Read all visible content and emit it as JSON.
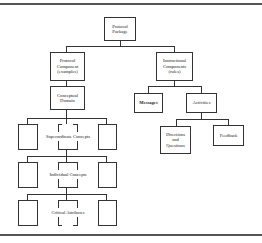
{
  "diagram": {
    "type": "hierarchy",
    "root": {
      "label": "Protocol Package",
      "children": [
        {
          "label": "Protocol Component (examples)",
          "children": [
            {
              "label": "Conceptual Domain",
              "children": [
                {
                  "level_label": "Superordinate Concepts",
                  "placeholders": 3
                },
                {
                  "level_label": "Individual Concepts",
                  "placeholders": 3
                },
                {
                  "level_label": "Critical Attributes",
                  "placeholders": 3
                }
              ]
            }
          ]
        },
        {
          "label": "Instructional Components (rules)",
          "children": [
            {
              "label": "Messages"
            },
            {
              "label": "Activities",
              "children": [
                {
                  "label": "Directions and Questions"
                },
                {
                  "label": "Feedback"
                }
              ]
            }
          ]
        }
      ]
    }
  },
  "nodes": {
    "protocol_package": [
      "Protocol",
      "Package"
    ],
    "protocol_component": [
      "Protocol",
      "Component",
      "(examples)"
    ],
    "instructional_components": [
      "Instructional",
      "Components",
      "(rules)"
    ],
    "conceptual_domain": [
      "Conceptual",
      "Domain"
    ],
    "messages": "Messages",
    "activities": "Activities",
    "directions_questions": [
      "Directions",
      "and",
      "Questions"
    ],
    "feedback": "Feedback",
    "superordinate": "Superordinate Concepts",
    "individual": "Individual Concepts",
    "critical": "Critical Attributes"
  }
}
